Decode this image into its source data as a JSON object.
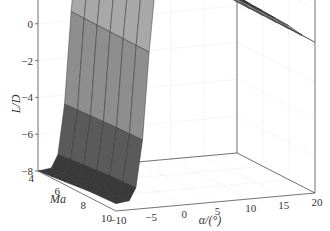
{
  "chart_data": {
    "type": "surface3d",
    "title": "",
    "xlabel": "α/(°)",
    "ylabel": "Ma",
    "zlabel": "L/D",
    "xlim": [
      -10,
      20
    ],
    "ylim": [
      4,
      10
    ],
    "zlim": [
      -8,
      8
    ],
    "x_ticks": [
      "-10",
      "-5",
      "0",
      "5",
      "10",
      "15",
      "20"
    ],
    "y_ticks": [
      "4",
      "6",
      "8",
      "10"
    ],
    "z_ticks": [
      "8",
      "6",
      "4",
      "2",
      "0",
      "-2",
      "-4",
      "-6",
      "-8"
    ],
    "grid": true,
    "colormap": "gray (dark = low, light = mid, dark = high)",
    "alpha": [
      -10,
      -8,
      -7,
      -6,
      -5,
      -4,
      -3,
      -2,
      -1,
      0,
      1,
      2,
      4,
      6,
      8,
      10,
      12,
      14,
      16,
      18,
      20
    ],
    "Ma": [
      4,
      5,
      6,
      7,
      8,
      9,
      10
    ],
    "LD_vs_alpha": [
      -8,
      -7.9,
      -7.2,
      -4.5,
      0.5,
      4.5,
      5.8,
      6.2,
      6.0,
      5.7,
      5.4,
      5.1,
      4.5,
      3.9,
      3.3,
      2.8,
      2.3,
      1.8,
      1.3,
      0.7,
      0.2
    ],
    "Ma_scaling": [
      1.0,
      0.99,
      0.98,
      0.97,
      0.96,
      0.955,
      0.95
    ]
  }
}
